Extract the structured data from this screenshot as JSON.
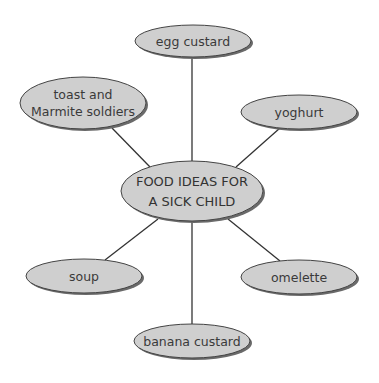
{
  "diagram": {
    "type": "spider-diagram",
    "colors": {
      "node_fill": "#cfcfcf",
      "node_stroke": "#444444",
      "shadow": "#6a6a6a",
      "line": "#333333",
      "background": "#ffffff"
    },
    "center": {
      "lines": [
        "FOOD IDEAS FOR",
        "A SICK CHILD"
      ],
      "cx": 192,
      "cy": 191,
      "rx": 71,
      "ry": 30
    },
    "nodes": [
      {
        "id": "egg-custard",
        "lines": [
          "egg custard"
        ],
        "cx": 193,
        "cy": 41,
        "rx": 58,
        "ry": 16,
        "line_from": [
          192,
          161
        ],
        "line_to": [
          192,
          57
        ]
      },
      {
        "id": "toast-and-marmite-soldiers",
        "lines": [
          "toast and",
          "Marmite soldiers"
        ],
        "cx": 83,
        "cy": 103,
        "rx": 63,
        "ry": 26,
        "line_from": [
          150,
          167
        ],
        "line_to": [
          112,
          128
        ]
      },
      {
        "id": "yoghurt",
        "lines": [
          "yoghurt"
        ],
        "cx": 299,
        "cy": 112,
        "rx": 58,
        "ry": 17,
        "line_from": [
          236,
          167
        ],
        "line_to": [
          280,
          128
        ]
      },
      {
        "id": "soup",
        "lines": [
          "soup"
        ],
        "cx": 84,
        "cy": 276,
        "rx": 58,
        "ry": 17,
        "line_from": [
          158,
          219
        ],
        "line_to": [
          105,
          260
        ]
      },
      {
        "id": "omelette",
        "lines": [
          "omelette"
        ],
        "cx": 299,
        "cy": 277,
        "rx": 58,
        "ry": 17,
        "line_from": [
          228,
          219
        ],
        "line_to": [
          280,
          261
        ]
      },
      {
        "id": "banana-custard",
        "lines": [
          "banana custard"
        ],
        "cx": 192,
        "cy": 341,
        "rx": 58,
        "ry": 17,
        "line_from": [
          192,
          221
        ],
        "line_to": [
          192,
          324
        ]
      }
    ]
  }
}
